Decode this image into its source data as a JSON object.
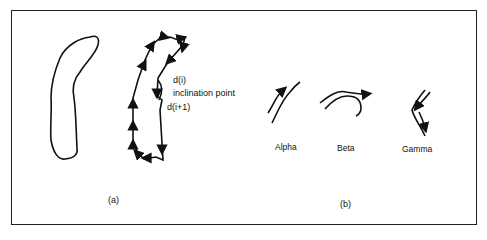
{
  "figure": {
    "panel_a": {
      "label": "(a)",
      "annotations": {
        "d_i": "d(i)",
        "inclination_point": "inclination point",
        "d_i_plus_1": "d(i+1)"
      }
    },
    "panel_b": {
      "label": "(b)",
      "shapes": [
        {
          "name": "Alpha"
        },
        {
          "name": "Beta"
        },
        {
          "name": "Gamma"
        }
      ]
    }
  }
}
